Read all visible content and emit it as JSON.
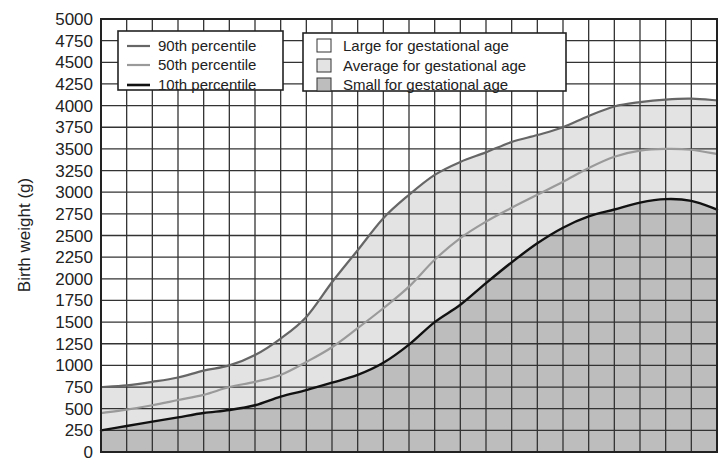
{
  "chart_data": {
    "type": "area",
    "title": "",
    "xlabel": "",
    "ylabel": "Birth weight (g)",
    "ylim": [
      0,
      5000
    ],
    "ytick_step": 250,
    "yticks": [
      "0",
      "250",
      "500",
      "750",
      "1000",
      "1250",
      "1500",
      "1750",
      "2000",
      "2250",
      "2500",
      "2750",
      "3000",
      "3250",
      "3500",
      "3750",
      "4000",
      "4250",
      "4500",
      "4750",
      "5000"
    ],
    "x_columns": 24,
    "x": [
      0,
      1,
      2,
      3,
      4,
      5,
      6,
      7,
      8,
      9,
      10,
      11,
      12,
      13,
      14,
      15,
      16,
      17,
      18,
      19,
      20,
      21,
      22,
      23,
      24
    ],
    "grid": true,
    "series": [
      {
        "name": "90th percentile",
        "color": "#666666",
        "width": 2.2,
        "values": [
          750,
          770,
          810,
          860,
          940,
          1000,
          1120,
          1310,
          1560,
          1960,
          2330,
          2700,
          2970,
          3200,
          3350,
          3460,
          3580,
          3660,
          3750,
          3880,
          3990,
          4040,
          4070,
          4080,
          4060
        ]
      },
      {
        "name": "50th percentile",
        "color": "#9a9a9a",
        "width": 2.2,
        "values": [
          450,
          490,
          540,
          600,
          660,
          750,
          810,
          890,
          1040,
          1210,
          1430,
          1660,
          1910,
          2220,
          2470,
          2660,
          2820,
          2970,
          3120,
          3280,
          3410,
          3480,
          3500,
          3490,
          3440
        ]
      },
      {
        "name": "10th percentile",
        "color": "#111111",
        "width": 2.4,
        "values": [
          250,
          300,
          350,
          400,
          450,
          485,
          540,
          640,
          715,
          800,
          890,
          1030,
          1240,
          1500,
          1700,
          1950,
          2190,
          2410,
          2590,
          2720,
          2800,
          2880,
          2920,
          2900,
          2800
        ]
      }
    ],
    "regions": [
      {
        "name": "Large for gestational age",
        "fill": "#ffffff",
        "between": [
          "top",
          "90th percentile"
        ]
      },
      {
        "name": "Average for gestational age",
        "fill": "#e3e3e3",
        "between": [
          "90th percentile",
          "10th percentile"
        ]
      },
      {
        "name": "Small for gestational age",
        "fill": "#bdbdbd",
        "between": [
          "10th percentile",
          "bottom"
        ]
      }
    ],
    "legend_lines": [
      {
        "label": "90th percentile",
        "color": "#666666"
      },
      {
        "label": "50th percentile",
        "color": "#9a9a9a"
      },
      {
        "label": "10th percentile",
        "color": "#111111"
      }
    ],
    "legend_regions": [
      {
        "label": "Large for gestational age",
        "fill": "#ffffff"
      },
      {
        "label": "Average for gestational age",
        "fill": "#e3e3e3"
      },
      {
        "label": "Small for gestational age",
        "fill": "#bdbdbd"
      }
    ],
    "legend_position": "upper-left inside plot"
  },
  "layout": {
    "plot": {
      "left": 101,
      "top": 19,
      "right": 717,
      "bottom": 452
    }
  }
}
